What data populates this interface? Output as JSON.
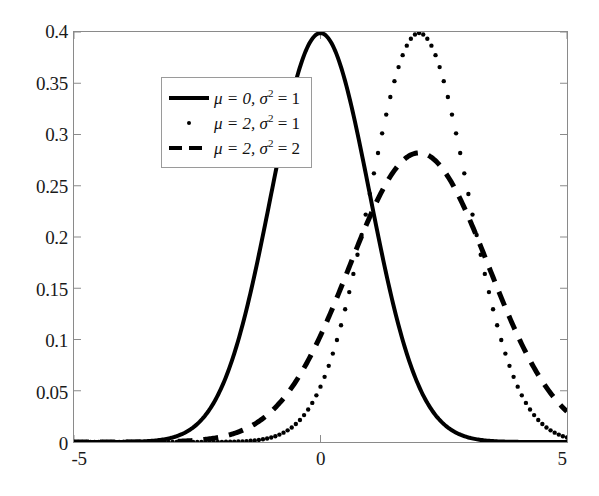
{
  "chart_data": {
    "type": "line",
    "title": "",
    "xlabel": "",
    "ylabel": "",
    "xlim": [
      -5,
      5
    ],
    "ylim": [
      0,
      0.4
    ],
    "grid": false,
    "legend_position": "top-left",
    "x_ticks": [
      "-5",
      "0",
      "5"
    ],
    "x_tick_values": [
      -5,
      0,
      5
    ],
    "y_ticks": [
      "0",
      "0.05",
      "0.1",
      "0.15",
      "0.2",
      "0.25",
      "0.3",
      "0.35",
      "0.4"
    ],
    "y_tick_values": [
      0,
      0.05,
      0.1,
      0.15,
      0.2,
      0.25,
      0.3,
      0.35,
      0.4
    ],
    "series": [
      {
        "name": "mu = 0, sigma^2 = 1",
        "mu": 0,
        "sigma2": 1,
        "style": "solid",
        "peak_x": 0,
        "peak_y": 0.4,
        "x": [
          -5,
          -4.5,
          -4,
          -3.5,
          -3,
          -2.5,
          -2,
          -1.5,
          -1,
          -0.5,
          0,
          0.5,
          1,
          1.5,
          2,
          2.5,
          3,
          3.5,
          4,
          4.5,
          5
        ],
        "values": [
          1.5e-06,
          1.6e-05,
          0.0001338,
          0.0008727,
          0.0044318,
          0.0175283,
          0.053991,
          0.1295176,
          0.2419707,
          0.3520653,
          0.3989423,
          0.3520653,
          0.2419707,
          0.1295176,
          0.053991,
          0.0175283,
          0.0044318,
          0.0008727,
          0.0001338,
          1.6e-05,
          1.5e-06
        ]
      },
      {
        "name": "mu = 2, sigma^2 = 1",
        "mu": 2,
        "sigma2": 1,
        "style": "dotted",
        "peak_x": 2,
        "peak_y": 0.4,
        "x": [
          -5,
          -4.5,
          -4,
          -3.5,
          -3,
          -2.5,
          -2,
          -1.5,
          -1,
          -0.5,
          0,
          0.5,
          1,
          1.5,
          2,
          2.5,
          3,
          3.5,
          4,
          4.5,
          5
        ],
        "values": [
          0.0,
          0.0,
          1e-07,
          1.5e-06,
          1.6e-05,
          0.0001338,
          0.0008727,
          0.0044318,
          0.0175283,
          0.053991,
          0.1295176,
          0.2419707,
          0.3520653,
          0.3989423,
          0.3989423,
          0.3520653,
          0.2419707,
          0.1295176,
          0.053991,
          0.0175283,
          0.0044318
        ]
      },
      {
        "name": "mu = 2, sigma^2 = 2",
        "mu": 2,
        "sigma2": 2,
        "style": "dashed",
        "peak_x": 2,
        "peak_y": 0.1995,
        "x": [
          -5,
          -4.5,
          -4,
          -3.5,
          -3,
          -2.5,
          -2,
          -1.5,
          -1,
          -0.5,
          0,
          0.5,
          1,
          1.5,
          2,
          2.5,
          3,
          3.5,
          4,
          4.5,
          5
        ],
        "values": [
          2.74e-05,
          9.76e-05,
          0.0003117,
          0.0008943,
          0.0023262,
          0.0055432,
          0.0120985,
          0.0242161,
          0.0444353,
          0.0747451,
          0.113993,
          0.1579003,
          0.1994711,
          0.2255661,
          0.225079,
          0.2062702,
          0.1760327,
          0.1256693,
          0.0913245,
          0.0622153,
          0.0396953
        ]
      }
    ]
  },
  "legend": {
    "entries": [
      {
        "mu_label": "μ = 0,",
        "sigma_label": "σ",
        "sup": "2",
        "eq_label": "= 1",
        "marker": "solid"
      },
      {
        "mu_label": "μ = 2,",
        "sigma_label": "σ",
        "sup": "2",
        "eq_label": "= 1",
        "marker": "dotted"
      },
      {
        "mu_label": "μ = 2,",
        "sigma_label": "σ",
        "sup": "2",
        "eq_label": "= 2",
        "marker": "dashed"
      }
    ]
  },
  "colors": {
    "curve": "#000000",
    "axis": "#8a8a8a",
    "text": "#1a1a1a",
    "background": "#ffffff"
  }
}
